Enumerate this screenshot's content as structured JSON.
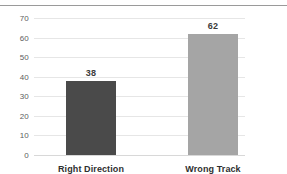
{
  "chart_data": {
    "type": "bar",
    "title": "",
    "subtitle": "",
    "xlabel": "",
    "ylabel": "",
    "categories": [
      "Right Direction",
      "Wrong Track"
    ],
    "values": [
      38,
      62
    ],
    "data_labels": [
      "38",
      "62"
    ],
    "series": [
      {
        "name": "",
        "values": [
          38,
          62
        ]
      }
    ],
    "ylim": [
      0,
      70
    ],
    "ytick_step": 10,
    "yticks": [
      70,
      60,
      50,
      40,
      30,
      20,
      10,
      0
    ],
    "ytick_labels": [
      "70",
      "60",
      "50",
      "40",
      "30",
      "20",
      "10",
      "0"
    ],
    "grid": "horizontal",
    "legend": "none",
    "bar_colors": [
      "#4a4a4a",
      "#a5a5a5"
    ],
    "gridline_color": "#e6e6e6",
    "axis_text_color": "#5d5d5d",
    "label_text_color": "#2f2f2f",
    "background_color": "#ffffff",
    "top_rule_color": "#9a9a9a"
  }
}
